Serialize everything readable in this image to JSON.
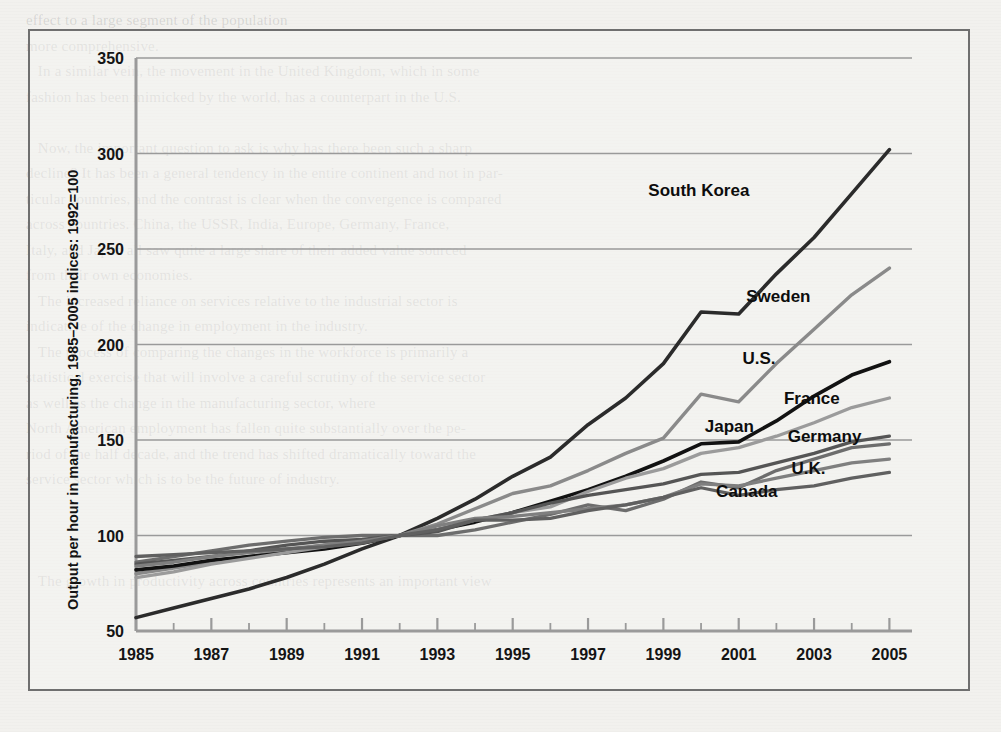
{
  "page": {
    "ghost_text": "effect to a large segment of the population\nmore comprehensive.\n   In a similar vein, the movement in the United Kingdom, which in some\nfashion has been mimicked by the world, has a counterpart in the U.S.\n\n   Now, the important question to ask is why has there been such a sharp\ndecline? It has been a general tendency in the entire continent and not in par-\nticular countries, and the contrast is clear when the convergence is compared\nacross countries. China, the USSR, India, Europe, Germany, France,\nItaly, and Japan all saw quite a large share of their added value sourced\nfrom their own economies.\n   The increased reliance on services relative to the industrial sector is\nindicative of the change in employment in the industry.\n   The process of comparing the changes in the workforce is primarily a\nstatistical exercise that will involve a careful scrutiny of the service sector\nas well as the change in the manufacturing sector, where\nNorth American employment has fallen quite substantially over the pe-\nriod of the half decade, and the trend has shifted dramatically toward the\nservice sector which is to be the future of industry.\n\n\n\n   The growth in productivity across countries represents an important view"
  },
  "chart_data": {
    "type": "line",
    "title": "",
    "xlabel": "",
    "ylabel": "Output per hour in manufacturing, 1985–2005 indices: 1992=100",
    "xlim": [
      1985,
      2005.6
    ],
    "ylim": [
      50,
      350
    ],
    "yticks": [
      50,
      100,
      150,
      200,
      250,
      300,
      350
    ],
    "xticks_labeled": [
      1985,
      1987,
      1989,
      1991,
      1993,
      1995,
      1997,
      1999,
      2001,
      2003,
      2005
    ],
    "xticks_minor": [
      1986,
      1988,
      1990,
      1992,
      1994,
      1996,
      1998,
      2000,
      2002,
      2004
    ],
    "grid": "horizontal",
    "legend_position": "inline-right-labels",
    "base_year": 1992,
    "base_value": 100,
    "x": [
      1985,
      1986,
      1987,
      1988,
      1989,
      1990,
      1991,
      1992,
      1993,
      1994,
      1995,
      1996,
      1997,
      1998,
      1999,
      2000,
      2001,
      2002,
      2003,
      2004,
      2005
    ],
    "series": [
      {
        "name": "South Korea",
        "color": "#2b2b2b",
        "width": 3.6,
        "label_x": 1998.6,
        "label_y": 278,
        "values": [
          57,
          62,
          67,
          72,
          78,
          85,
          93,
          100,
          109,
          119,
          131,
          141,
          158,
          172,
          190,
          217,
          216,
          237,
          256,
          279,
          302
        ]
      },
      {
        "name": "Sweden",
        "color": "#8a8a8a",
        "width": 3.4,
        "label_x": 2001.2,
        "label_y": 222,
        "values": [
          80,
          83,
          86,
          89,
          92,
          95,
          97,
          100,
          106,
          114,
          122,
          126,
          134,
          143,
          151,
          174,
          170,
          190,
          208,
          226,
          240
        ]
      },
      {
        "name": "U.S.",
        "color": "#121212",
        "width": 3.6,
        "label_x": 2001.1,
        "label_y": 190,
        "values": [
          82,
          84,
          87,
          89,
          91,
          93,
          96,
          100,
          103,
          107,
          112,
          118,
          124,
          131,
          139,
          148,
          149,
          160,
          173,
          184,
          191
        ]
      },
      {
        "name": "France",
        "color": "#9b9b9b",
        "width": 3.3,
        "label_x": 2002.2,
        "label_y": 169,
        "values": [
          78,
          81,
          85,
          88,
          91,
          94,
          97,
          100,
          103,
          108,
          112,
          115,
          123,
          130,
          135,
          143,
          146,
          152,
          159,
          167,
          172
        ]
      },
      {
        "name": "Japan",
        "color": "#6d6d6d",
        "width": 3.3,
        "label_x": 2000.1,
        "label_y": 154,
        "values": [
          86,
          89,
          92,
          95,
          97,
          99,
          100,
          100,
          100,
          103,
          107,
          111,
          116,
          113,
          119,
          128,
          125,
          134,
          140,
          146,
          148
        ]
      },
      {
        "name": "Germany",
        "color": "#555555",
        "width": 3.3,
        "label_x": 2002.3,
        "label_y": 149,
        "values": [
          85,
          87,
          89,
          92,
          95,
          97,
          98,
          100,
          102,
          108,
          112,
          117,
          121,
          124,
          127,
          132,
          133,
          138,
          143,
          149,
          152
        ]
      },
      {
        "name": "U.K.",
        "color": "#7f7f7f",
        "width": 3.3,
        "label_x": 2002.4,
        "label_y": 132,
        "values": [
          84,
          86,
          89,
          91,
          93,
          95,
          97,
          100,
          105,
          109,
          110,
          112,
          114,
          116,
          120,
          127,
          126,
          130,
          134,
          138,
          140
        ]
      },
      {
        "name": "Canada",
        "color": "#606060",
        "width": 3.3,
        "label_x": 2000.4,
        "label_y": 120,
        "values": [
          89,
          90,
          91,
          92,
          93,
          94,
          96,
          100,
          103,
          108,
          108,
          109,
          113,
          116,
          120,
          125,
          121,
          124,
          126,
          130,
          133
        ]
      }
    ]
  }
}
